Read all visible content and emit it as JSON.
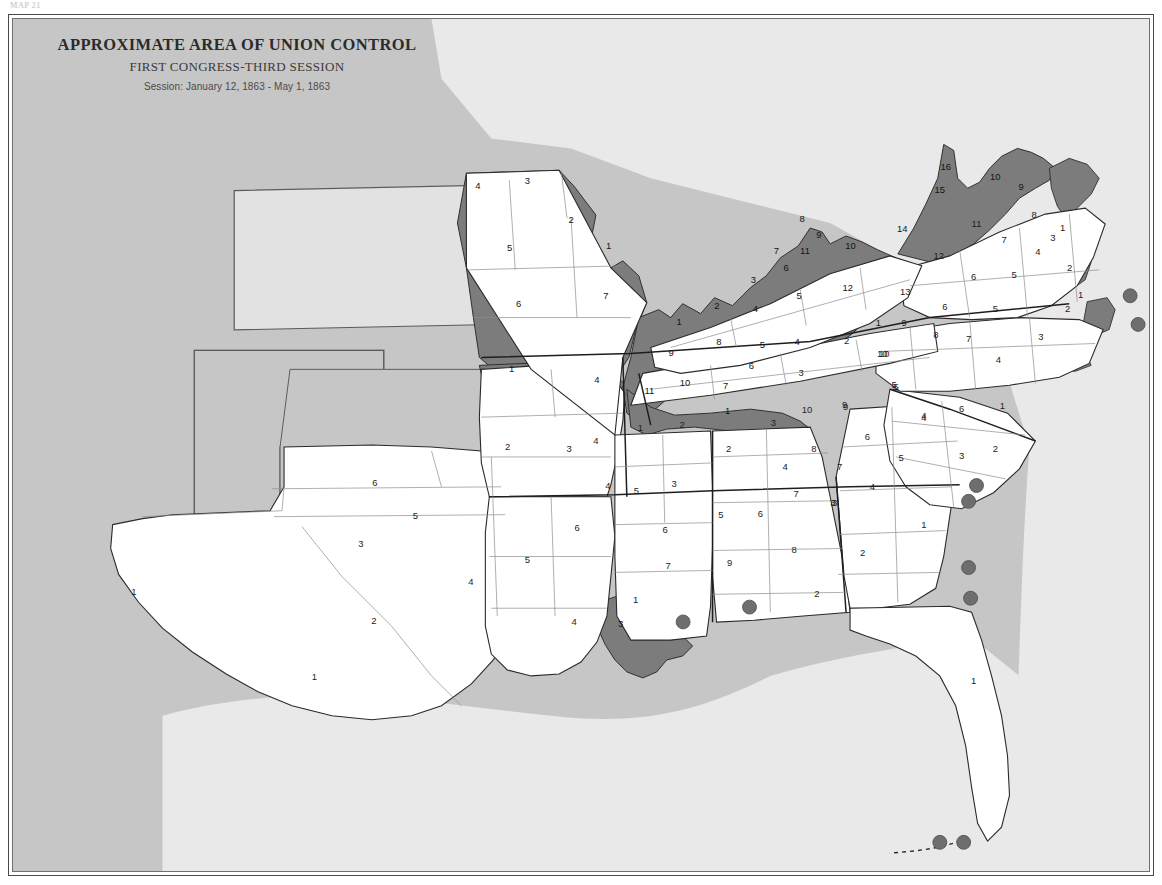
{
  "plate": {
    "header_note": "MAP 21",
    "frame_color": "#4a4a4a"
  },
  "title": {
    "main": "APPROXIMATE AREA OF UNION CONTROL",
    "sub": "FIRST CONGRESS-THIRD SESSION",
    "session": "Session: January 12, 1863 - May 1, 1863"
  },
  "colors": {
    "union_control": "#7c7c7c",
    "confederate_unshaded": "#ffffff",
    "outside_map": "#c6c6c6",
    "water_and_background": "#e8e8e8",
    "kansas_fill": "#e2e2e2",
    "territory_fill": "#c6c6c6",
    "boundary_line": "#3a3a3a",
    "state_line": "#1e1e1e",
    "port_dot": "#6e6e6e"
  },
  "legend_semantics": {
    "shaded_meaning": "Approximate area of Union control",
    "unshaded_meaning": "Area under Confederate control",
    "dot_meaning": "Union-held coastal position / port"
  },
  "chart_data": {
    "type": "map",
    "title": "APPROXIMATE AREA OF UNION CONTROL",
    "subtitle": "FIRST CONGRESS-THIRD SESSION",
    "period": "January 12, 1863 - May 1, 1863",
    "projection": "Confederate States congressional districts",
    "states": [
      {
        "name": "Missouri",
        "union_controlled": true,
        "districts": [
          {
            "n": "4",
            "x": 478,
            "y": 185,
            "union": true
          },
          {
            "n": "3",
            "x": 528,
            "y": 180,
            "union": true
          },
          {
            "n": "2",
            "x": 572,
            "y": 220,
            "union": true
          },
          {
            "n": "5",
            "x": 510,
            "y": 248,
            "union": true
          },
          {
            "n": "1",
            "x": 610,
            "y": 246,
            "union": true
          },
          {
            "n": "6",
            "x": 519,
            "y": 305,
            "union": true
          },
          {
            "n": "7",
            "x": 607,
            "y": 297,
            "union": true
          }
        ]
      },
      {
        "name": "Arkansas",
        "union_controlled": false,
        "districts": [
          {
            "n": "1",
            "x": 512,
            "y": 371,
            "union": false
          },
          {
            "n": "4",
            "x": 598,
            "y": 382,
            "union": true
          },
          {
            "n": "2",
            "x": 508,
            "y": 450,
            "union": false
          },
          {
            "n": "3",
            "x": 570,
            "y": 452,
            "union": false
          }
        ]
      },
      {
        "name": "Kentucky",
        "union_controlled": true,
        "districts": [
          {
            "n": "8",
            "x": 805,
            "y": 219,
            "union": true
          },
          {
            "n": "9",
            "x": 822,
            "y": 235,
            "union": true
          },
          {
            "n": "7",
            "x": 779,
            "y": 251,
            "union": true
          },
          {
            "n": "11",
            "x": 808,
            "y": 251,
            "union": true
          },
          {
            "n": "10",
            "x": 854,
            "y": 246,
            "union": true
          },
          {
            "n": "6",
            "x": 789,
            "y": 268,
            "union": true
          },
          {
            "n": "3",
            "x": 756,
            "y": 281,
            "union": true
          },
          {
            "n": "5",
            "x": 802,
            "y": 297,
            "union": true
          },
          {
            "n": "2",
            "x": 719,
            "y": 307,
            "union": true
          },
          {
            "n": "4",
            "x": 758,
            "y": 310,
            "union": true
          },
          {
            "n": "12",
            "x": 851,
            "y": 289,
            "union": true
          },
          {
            "n": "1",
            "x": 681,
            "y": 323,
            "union": true
          }
        ]
      },
      {
        "name": "Tennessee",
        "union_controlled": false,
        "districts": [
          {
            "n": "8",
            "x": 721,
            "y": 343,
            "union": true
          },
          {
            "n": "5",
            "x": 765,
            "y": 346,
            "union": true
          },
          {
            "n": "9",
            "x": 673,
            "y": 354,
            "union": true
          },
          {
            "n": "6",
            "x": 754,
            "y": 368,
            "union": true
          },
          {
            "n": "4",
            "x": 800,
            "y": 343,
            "union": false
          },
          {
            "n": "13",
            "x": 909,
            "y": 293,
            "union": false
          },
          {
            "n": "7",
            "x": 728,
            "y": 388,
            "union": false
          },
          {
            "n": "3",
            "x": 804,
            "y": 375,
            "union": false
          },
          {
            "n": "1",
            "x": 882,
            "y": 324,
            "union": false
          },
          {
            "n": "2",
            "x": 850,
            "y": 342,
            "union": false
          },
          {
            "n": "10",
            "x": 888,
            "y": 355,
            "union": false
          },
          {
            "n": "11",
            "x": 651,
            "y": 393,
            "union": true
          },
          {
            "n": "10b",
            "x": 687,
            "y": 385,
            "union": true
          }
        ]
      },
      {
        "name": "Virginia",
        "union_controlled": false,
        "districts": [
          {
            "n": "16",
            "x": 950,
            "y": 166,
            "union": true
          },
          {
            "n": "15",
            "x": 944,
            "y": 190,
            "union": true
          },
          {
            "n": "14",
            "x": 906,
            "y": 229,
            "union": true
          },
          {
            "n": "10",
            "x": 1000,
            "y": 176,
            "union": true
          },
          {
            "n": "9",
            "x": 1026,
            "y": 186,
            "union": true
          },
          {
            "n": "11",
            "x": 981,
            "y": 224,
            "union": false
          },
          {
            "n": "8",
            "x": 1039,
            "y": 215,
            "union": false
          },
          {
            "n": "1",
            "x": 1068,
            "y": 228,
            "union": false
          },
          {
            "n": "3",
            "x": 1058,
            "y": 238,
            "union": false
          },
          {
            "n": "12",
            "x": 943,
            "y": 256,
            "union": false
          },
          {
            "n": "4",
            "x": 1043,
            "y": 252,
            "union": false
          },
          {
            "n": "5",
            "x": 1019,
            "y": 276,
            "union": false
          },
          {
            "n": "6",
            "x": 978,
            "y": 278,
            "union": false
          },
          {
            "n": "2",
            "x": 1075,
            "y": 268,
            "union": false
          },
          {
            "n": "7",
            "x": 1009,
            "y": 240,
            "union": false
          },
          {
            "n": "1b",
            "x": 1086,
            "y": 296,
            "union": false
          }
        ]
      },
      {
        "name": "North Carolina",
        "union_controlled": false,
        "districts": [
          {
            "n": "9",
            "x": 908,
            "y": 324,
            "union": false
          },
          {
            "n": "6",
            "x": 949,
            "y": 308,
            "union": false
          },
          {
            "n": "5",
            "x": 1000,
            "y": 310,
            "union": false
          },
          {
            "n": "2",
            "x": 1073,
            "y": 310,
            "union": false
          },
          {
            "n": "8",
            "x": 940,
            "y": 336,
            "union": false
          },
          {
            "n": "7",
            "x": 973,
            "y": 340,
            "union": false
          },
          {
            "n": "3",
            "x": 1046,
            "y": 338,
            "union": false
          },
          {
            "n": "10",
            "x": 886,
            "y": 355,
            "union": false
          },
          {
            "n": "4",
            "x": 1003,
            "y": 362,
            "union": false
          }
        ]
      },
      {
        "name": "South Carolina",
        "union_controlled": false,
        "districts": [
          {
            "n": "5",
            "x": 898,
            "y": 387,
            "union": false
          },
          {
            "n": "4",
            "x": 928,
            "y": 418,
            "union": false
          },
          {
            "n": "6",
            "x": 966,
            "y": 411,
            "union": false
          },
          {
            "n": "1",
            "x": 1007,
            "y": 408,
            "union": false
          },
          {
            "n": "3",
            "x": 966,
            "y": 459,
            "union": false
          },
          {
            "n": "2",
            "x": 1000,
            "y": 452,
            "union": false
          }
        ]
      },
      {
        "name": "Georgia",
        "union_controlled": false,
        "districts": [
          {
            "n": "9",
            "x": 848,
            "y": 407,
            "union": false
          },
          {
            "n": "5",
            "x": 900,
            "y": 389,
            "union": false
          },
          {
            "n": "6",
            "x": 871,
            "y": 439,
            "union": false
          },
          {
            "n": "4",
            "x": 928,
            "y": 420,
            "union": false
          },
          {
            "n": "7",
            "x": 843,
            "y": 470,
            "union": false
          },
          {
            "n": "5b",
            "x": 905,
            "y": 461,
            "union": false
          },
          {
            "n": "3",
            "x": 836,
            "y": 506,
            "union": false
          },
          {
            "n": "4b",
            "x": 876,
            "y": 490,
            "union": false
          },
          {
            "n": "1",
            "x": 928,
            "y": 528,
            "union": false
          },
          {
            "n": "2",
            "x": 866,
            "y": 557,
            "union": false
          }
        ]
      },
      {
        "name": "Alabama",
        "union_controlled": false,
        "districts": [
          {
            "n": "1",
            "x": 730,
            "y": 413,
            "union": true
          },
          {
            "n": "3",
            "x": 776,
            "y": 425,
            "union": false
          },
          {
            "n": "10",
            "x": 810,
            "y": 412,
            "union": false
          },
          {
            "n": "9",
            "x": 849,
            "y": 409,
            "union": false
          },
          {
            "n": "2",
            "x": 731,
            "y": 452,
            "union": false
          },
          {
            "n": "8",
            "x": 817,
            "y": 452,
            "union": false
          },
          {
            "n": "4",
            "x": 788,
            "y": 470,
            "union": false
          },
          {
            "n": "7",
            "x": 799,
            "y": 497,
            "union": false
          },
          {
            "n": "3b",
            "x": 838,
            "y": 506,
            "union": false
          },
          {
            "n": "6",
            "x": 763,
            "y": 517,
            "union": false
          },
          {
            "n": "5",
            "x": 723,
            "y": 518,
            "union": false
          },
          {
            "n": "8b",
            "x": 797,
            "y": 554,
            "union": false
          },
          {
            "n": "9b",
            "x": 732,
            "y": 567,
            "union": false
          },
          {
            "n": "2b",
            "x": 820,
            "y": 598,
            "union": false
          }
        ]
      },
      {
        "name": "Mississippi",
        "union_controlled": false,
        "districts": [
          {
            "n": "1",
            "x": 642,
            "y": 430,
            "union": false
          },
          {
            "n": "2",
            "x": 684,
            "y": 427,
            "union": false
          },
          {
            "n": "5",
            "x": 638,
            "y": 494,
            "union": false
          },
          {
            "n": "3",
            "x": 676,
            "y": 487,
            "union": false
          },
          {
            "n": "6",
            "x": 667,
            "y": 534,
            "union": false
          },
          {
            "n": "4",
            "x": 609,
            "y": 489,
            "union": false
          },
          {
            "n": "7",
            "x": 670,
            "y": 570,
            "union": false
          }
        ]
      },
      {
        "name": "Louisiana",
        "union_controlled": false,
        "districts": [
          {
            "n": "4",
            "x": 597,
            "y": 443,
            "union": false
          },
          {
            "n": "5",
            "x": 528,
            "y": 564,
            "union": false
          },
          {
            "n": "6",
            "x": 578,
            "y": 531,
            "union": false
          },
          {
            "n": "4b",
            "x": 575,
            "y": 627,
            "union": false
          },
          {
            "n": "1",
            "x": 637,
            "y": 604,
            "union": false
          },
          {
            "n": "3",
            "x": 622,
            "y": 629,
            "union": true
          }
        ]
      },
      {
        "name": "Texas",
        "union_controlled": false,
        "districts": [
          {
            "n": "6",
            "x": 374,
            "y": 486,
            "union": false
          },
          {
            "n": "5",
            "x": 415,
            "y": 519,
            "union": false
          },
          {
            "n": "3",
            "x": 360,
            "y": 548,
            "union": false
          },
          {
            "n": "4",
            "x": 471,
            "y": 586,
            "union": false
          },
          {
            "n": "2",
            "x": 373,
            "y": 626,
            "union": false
          },
          {
            "n": "1",
            "x": 313,
            "y": 682,
            "union": false
          },
          {
            "n": "1b",
            "x": 131,
            "y": 596,
            "union": false
          }
        ]
      },
      {
        "name": "Florida",
        "union_controlled": false,
        "districts": [
          {
            "n": "1",
            "x": 978,
            "y": 686,
            "union": false
          }
        ]
      }
    ],
    "union_ports": [
      {
        "label": "Hatteras",
        "x": 1136,
        "y": 296
      },
      {
        "label": "Outer Banks",
        "x": 1144,
        "y": 325
      },
      {
        "label": "Port Royal",
        "x": 981,
        "y": 488
      },
      {
        "label": "Hilton Head",
        "x": 973,
        "y": 504
      },
      {
        "label": "Fernandina",
        "x": 973,
        "y": 571
      },
      {
        "label": "St. Augustine",
        "x": 975,
        "y": 602
      },
      {
        "label": "Ship Island",
        "x": 752,
        "y": 611
      },
      {
        "label": "Mississippi Delta",
        "x": 685,
        "y": 626
      },
      {
        "label": "Key West",
        "x": 944,
        "y": 849
      },
      {
        "label": "Tortugas",
        "x": 968,
        "y": 849
      }
    ],
    "territories": [
      {
        "name": "Kansas",
        "shaded": false
      },
      {
        "name": "Colorado Territory",
        "shaded": false
      },
      {
        "name": "New Mexico Territory",
        "shaded": false
      },
      {
        "name": "Indian Territory",
        "shaded": false
      }
    ]
  }
}
